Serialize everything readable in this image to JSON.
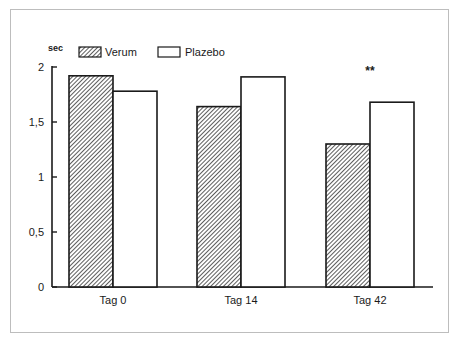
{
  "chart_data": {
    "type": "bar",
    "title": "",
    "xlabel": "",
    "ylabel": "sec",
    "ylim": [
      0,
      2
    ],
    "yticks": [
      0,
      0.5,
      1,
      1.5,
      2
    ],
    "ytick_labels": [
      "0",
      "0,5",
      "1",
      "1,5",
      "2"
    ],
    "categories": [
      "Tag 0",
      "Tag 14",
      "Tag 42"
    ],
    "series": [
      {
        "name": "Verum",
        "values": [
          1.92,
          1.64,
          1.3
        ],
        "fill": "hatched"
      },
      {
        "name": "Plazebo",
        "values": [
          1.78,
          1.91,
          1.68
        ],
        "fill": "white"
      }
    ],
    "annotations": [
      {
        "text": "**",
        "category": "Tag 42"
      }
    ],
    "legend_position": "top",
    "grid": false
  },
  "colors": {
    "ink": "#1a1a1a",
    "frame": "#bdbdbd",
    "background": "#ffffff"
  }
}
